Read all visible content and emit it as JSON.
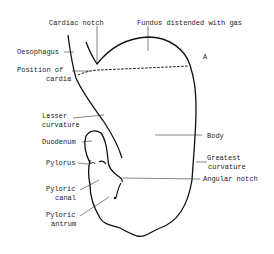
{
  "diagram": {
    "labels": {
      "cardiac_notch": "Cardiac notch",
      "fundus": "Fundus distended with gas",
      "oesophagus": "Oesophagus",
      "position_of_cardia_1": "Position of",
      "position_of_cardia_2": "cardia",
      "marker_a": "A",
      "lesser_curvature_1": "Lesser",
      "lesser_curvature_2": "curvature",
      "body": "Body",
      "duodenum": "Duodenum",
      "pylorus": "Pylorus",
      "greatest_curvature_1": "Greatest",
      "greatest_curvature_2": "curvature",
      "angular_notch": "Angular notch",
      "pyloric_canal_1": "Pyloric",
      "pyloric_canal_2": "canal",
      "pyloric_antrum_1": "Pyloric",
      "pyloric_antrum_2": "antrum"
    },
    "colors": {
      "outline": "#111111",
      "leader": "#333333",
      "text": "#222222"
    }
  }
}
